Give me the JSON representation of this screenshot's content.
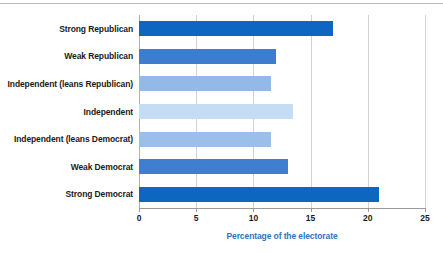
{
  "figure": {
    "background_color": "#ffffff",
    "top_rule_color": "#b9b9b9",
    "gridline_color": "#d2d2d2",
    "axis_color": "#9a9a9a",
    "label_color": "#1a1a1a",
    "axis_title_color": "#2f72bd"
  },
  "chart_data": {
    "type": "bar",
    "orientation": "horizontal",
    "title": "",
    "subtitle": "",
    "xlabel": "Percentage of the electorate",
    "ylabel": "",
    "xlim": [
      0,
      25
    ],
    "xticks": [
      0,
      5,
      10,
      15,
      20,
      25
    ],
    "xtick_labels": [
      "0",
      "5",
      "10",
      "15",
      "20",
      "25"
    ],
    "grid": true,
    "grid_axis": "x",
    "legend": false,
    "legend_position": "none",
    "categories": [
      "Strong Republican",
      "Weak Republican",
      "Independent (leans Republican)",
      "Independent",
      "Independent (leans Democrat)",
      "Weak Democrat",
      "Strong Democrat"
    ],
    "values": [
      17.0,
      12.0,
      11.5,
      13.5,
      11.5,
      13.0,
      21.0
    ],
    "bar_colors": [
      "#0d66bf",
      "#3d7dd0",
      "#93b9e8",
      "#c5ddf4",
      "#99bfea",
      "#3f7fd2",
      "#0d66bf"
    ],
    "series": [
      {
        "name": "Percentage of the electorate",
        "values": [
          17.0,
          12.0,
          11.5,
          13.5,
          11.5,
          13.0,
          21.0
        ]
      }
    ]
  }
}
